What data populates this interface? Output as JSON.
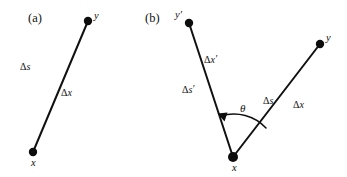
{
  "figure": {
    "width": 347,
    "height": 177,
    "background_color": "#ffffff",
    "stroke_color": "#111111",
    "panels": [
      {
        "id": "a",
        "label": "(a)",
        "label_x": 28,
        "label_y": 12,
        "description": "single displacement vector from point x to point y",
        "points": [
          {
            "name": "y",
            "label": "y",
            "cx": 88,
            "cy": 21,
            "r": 4.2,
            "label_x": 94,
            "label_y": 11
          },
          {
            "name": "x",
            "label": "x",
            "cx": 33,
            "cy": 152,
            "r": 4.2,
            "label_x": 31,
            "label_y": 158
          }
        ],
        "segments": [
          {
            "name": "x-to-y",
            "x1": 33,
            "y1": 152,
            "x2": 88,
            "y2": 21
          }
        ],
        "labels": [
          {
            "name": "delta-s",
            "text": "Δs",
            "var": "s",
            "x": 20,
            "y": 62
          },
          {
            "name": "delta-x",
            "text": "Δx",
            "var": "x",
            "x": 61,
            "y": 88
          }
        ]
      },
      {
        "id": "b",
        "label": "(b)",
        "label_x": 145,
        "label_y": 12,
        "description": "two displacement vectors sharing vertex x, separated by angle theta",
        "points": [
          {
            "name": "y-prime",
            "label": "y′",
            "cx": 189,
            "cy": 23,
            "r": 4.2,
            "label_x": 175,
            "label_y": 11
          },
          {
            "name": "y",
            "label": "y",
            "cx": 320,
            "cy": 44,
            "r": 4.2,
            "label_x": 326,
            "label_y": 34
          },
          {
            "name": "x",
            "label": "x",
            "cx": 233,
            "cy": 157,
            "r": 5.0,
            "label_x": 232,
            "label_y": 163
          }
        ],
        "segments": [
          {
            "name": "x-to-y-prime",
            "x1": 233,
            "y1": 157,
            "x2": 189,
            "y2": 23
          },
          {
            "name": "x-to-y",
            "x1": 233,
            "y1": 157,
            "x2": 320,
            "y2": 44
          }
        ],
        "labels": [
          {
            "name": "delta-x-prime",
            "text": "Δx′",
            "var": "x",
            "x": 204,
            "y": 55
          },
          {
            "name": "delta-s-prime",
            "text": "Δs′",
            "var": "s",
            "x": 182,
            "y": 85
          },
          {
            "name": "delta-s",
            "text": "Δs",
            "var": "s",
            "x": 263,
            "y": 96
          },
          {
            "name": "delta-x",
            "text": "Δx",
            "var": "x",
            "x": 293,
            "y": 100
          }
        ],
        "angle": {
          "name": "theta",
          "symbol": "θ",
          "label_x": 240,
          "label_y": 104,
          "arc_center_x": 233,
          "arc_center_y": 157,
          "arc_radius": 44,
          "arc_start_x": 265,
          "arc_start_y": 127,
          "arc_end_x": 220,
          "arc_end_y": 115,
          "arrow_tip_x": 218,
          "arrow_tip_y": 114,
          "arrowhead": "left-pointing"
        }
      }
    ]
  }
}
